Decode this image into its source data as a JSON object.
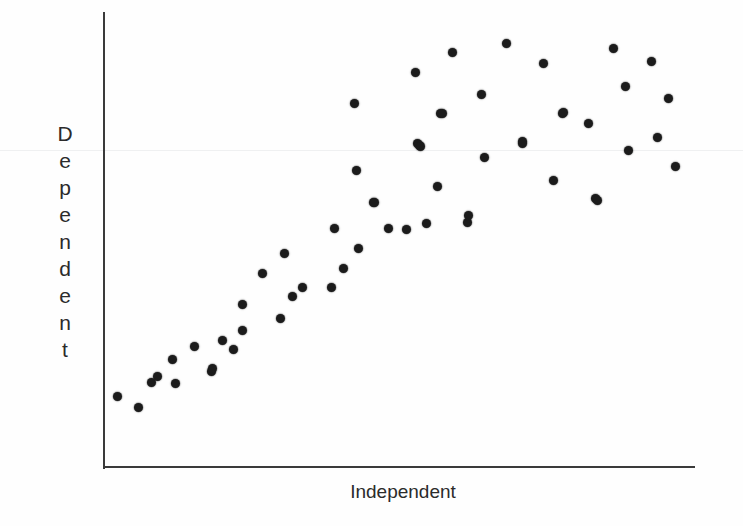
{
  "figure": {
    "width": 743,
    "height": 526,
    "background_color": "#fefefe",
    "point_color": "#1b1b1b",
    "axis_color": "#3a3a3a",
    "label_color": "#2b2b2b"
  },
  "axes": {
    "y_axis": {
      "x": 103,
      "top": 12,
      "bottom": 467,
      "thickness": 2
    },
    "x_axis": {
      "y": 467,
      "left": 103,
      "right": 695,
      "thickness": 2
    },
    "artifact_line_y": 150
  },
  "labels": {
    "y_axis_label": "Dependent",
    "y_axis_letters": [
      "D",
      "e",
      "p",
      "e",
      "n",
      "d",
      "e",
      "n",
      "t"
    ],
    "x_axis_label": "Independent"
  },
  "chart_data": {
    "type": "scatter",
    "title": "",
    "xlabel": "Independent",
    "ylabel": "Dependent",
    "grid": false,
    "legend": false,
    "tick_labels_x": [],
    "tick_labels_y": [],
    "axis_ranges": {
      "x_pixel": [
        103,
        695
      ],
      "y_pixel": [
        12,
        467
      ]
    },
    "n_points": 58,
    "points_pixel": [
      [
        117,
        396
      ],
      [
        138,
        407
      ],
      [
        151,
        382
      ],
      [
        157,
        376
      ],
      [
        172,
        359
      ],
      [
        175,
        383
      ],
      [
        194,
        346
      ],
      [
        211,
        371
      ],
      [
        212,
        368
      ],
      [
        222,
        340
      ],
      [
        233,
        349
      ],
      [
        242,
        330
      ],
      [
        242,
        304
      ],
      [
        262,
        273
      ],
      [
        280,
        318
      ],
      [
        284,
        253
      ],
      [
        292,
        296
      ],
      [
        302,
        287
      ],
      [
        331,
        287
      ],
      [
        334,
        228
      ],
      [
        343,
        268
      ],
      [
        354,
        103
      ],
      [
        356,
        170
      ],
      [
        358,
        248
      ],
      [
        373,
        202
      ],
      [
        374,
        202
      ],
      [
        388,
        228
      ],
      [
        406,
        229
      ],
      [
        419,
        145
      ],
      [
        415,
        72
      ],
      [
        417,
        143
      ],
      [
        420,
        146
      ],
      [
        426,
        223
      ],
      [
        437,
        186
      ],
      [
        440,
        113
      ],
      [
        442,
        113
      ],
      [
        452,
        52
      ],
      [
        467,
        222
      ],
      [
        468,
        215
      ],
      [
        481,
        94
      ],
      [
        484,
        157
      ],
      [
        506,
        43
      ],
      [
        522,
        141
      ],
      [
        522,
        143
      ],
      [
        543,
        63
      ],
      [
        553,
        180
      ],
      [
        562,
        113
      ],
      [
        563,
        112
      ],
      [
        588,
        123
      ],
      [
        595,
        198
      ],
      [
        613,
        48
      ],
      [
        625,
        86
      ],
      [
        628,
        150
      ],
      [
        651,
        61
      ],
      [
        657,
        137
      ],
      [
        668,
        98
      ],
      [
        675,
        166
      ],
      [
        597,
        200
      ]
    ],
    "x": [
      0.024,
      0.059,
      0.081,
      0.091,
      0.117,
      0.122,
      0.154,
      0.182,
      0.184,
      0.201,
      0.22,
      0.235,
      0.235,
      0.269,
      0.299,
      0.306,
      0.319,
      0.336,
      0.385,
      0.39,
      0.405,
      0.424,
      0.427,
      0.431,
      0.456,
      0.458,
      0.481,
      0.512,
      0.534,
      0.527,
      0.53,
      0.535,
      0.546,
      0.564,
      0.569,
      0.573,
      0.59,
      0.615,
      0.617,
      0.639,
      0.644,
      0.681,
      0.708,
      0.708,
      0.743,
      0.76,
      0.775,
      0.777,
      0.818,
      0.831,
      0.861,
      0.882,
      0.887,
      0.926,
      0.936,
      0.954,
      0.966,
      0.834
    ],
    "y": [
      0.156,
      0.132,
      0.187,
      0.2,
      0.237,
      0.184,
      0.266,
      0.211,
      0.218,
      0.279,
      0.259,
      0.301,
      0.358,
      0.426,
      0.327,
      0.47,
      0.376,
      0.396,
      0.396,
      0.525,
      0.437,
      0.8,
      0.653,
      0.481,
      0.582,
      0.582,
      0.525,
      0.523,
      0.708,
      0.868,
      0.712,
      0.706,
      0.536,
      0.618,
      0.778,
      0.778,
      0.912,
      0.538,
      0.554,
      0.82,
      0.681,
      0.932,
      0.716,
      0.712,
      0.888,
      0.63,
      0.778,
      0.78,
      0.756,
      0.591,
      0.92,
      0.837,
      0.696,
      0.892,
      0.725,
      0.81,
      0.661,
      0.587
    ]
  }
}
